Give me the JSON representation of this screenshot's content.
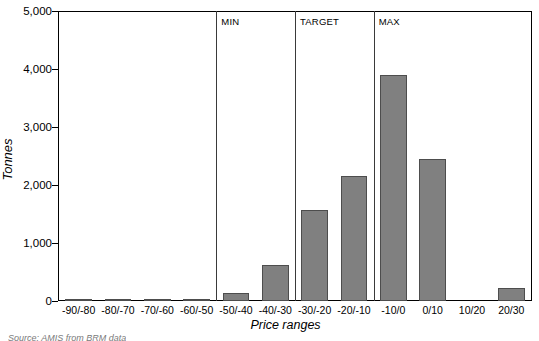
{
  "chart_data": {
    "type": "bar",
    "title": "",
    "xlabel": "Price ranges",
    "ylabel": "Tonnes",
    "categories": [
      "-90/-80",
      "-80/-70",
      "-70/-60",
      "-60/-50",
      "-50/-40",
      "-40/-30",
      "-30/-20",
      "-20/-10",
      "-10/0",
      "0/10",
      "10/20",
      "20/30"
    ],
    "values": [
      25,
      25,
      20,
      15,
      140,
      620,
      1570,
      2150,
      3900,
      2450,
      0,
      230
    ],
    "ylim": [
      0,
      5000
    ],
    "yticks": [
      0,
      1000,
      2000,
      3000,
      4000,
      5000
    ],
    "ytick_labels": [
      "0",
      "1,000",
      "2,000",
      "3,000",
      "4,000",
      "5,000"
    ],
    "grid": false,
    "legend": "none",
    "bar_color": "#808080",
    "bar_border_color": "#4d4d4d",
    "annotations": [
      {
        "label": "MIN",
        "category_boundary": "-60/-50 | -50/-40"
      },
      {
        "label": "TARGET",
        "category_boundary": "-40/-30 | -30/-20"
      },
      {
        "label": "MAX",
        "category_boundary": "-20/-10 | -10/0"
      }
    ]
  },
  "axes": {
    "y_title": "Tonnes",
    "x_title": "Price ranges",
    "y_ticks": [
      {
        "label": "5,000",
        "value": 5000
      },
      {
        "label": "4,000",
        "value": 4000
      },
      {
        "label": "3,000",
        "value": 3000
      },
      {
        "label": "2,000",
        "value": 2000
      },
      {
        "label": "1,000",
        "value": 1000
      },
      {
        "label": "0",
        "value": 0
      }
    ]
  },
  "markers": [
    {
      "name": "min",
      "label": "MIN"
    },
    {
      "name": "target",
      "label": "TARGET"
    },
    {
      "name": "max",
      "label": "MAX"
    }
  ],
  "footer": {
    "source_note": "Source: AMIS from BRM data"
  }
}
